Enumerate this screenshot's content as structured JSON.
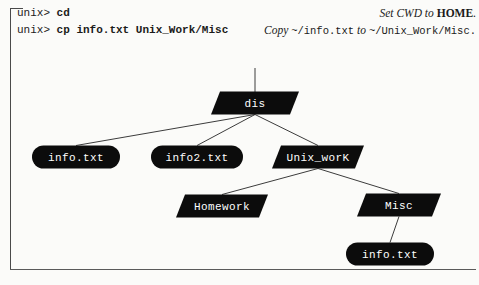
{
  "terminal": {
    "lines": [
      {
        "prompt": "unix> ",
        "command": "cd"
      },
      {
        "prompt": "unix> ",
        "command": "cp info.txt Unix_Work/Misc"
      }
    ]
  },
  "annotations": [
    {
      "parts": [
        {
          "text": "Set CWD to ",
          "style": "italic"
        },
        {
          "text": "HOME",
          "style": "bold"
        },
        {
          "text": ".",
          "style": "italic"
        }
      ]
    },
    {
      "parts": [
        {
          "text": "Copy ",
          "style": "italic"
        },
        {
          "text": "~/info.txt",
          "style": "mono"
        },
        {
          "text": " to ",
          "style": "italic"
        },
        {
          "text": "~/Unix_Work/Misc.",
          "style": "mono"
        }
      ]
    }
  ],
  "tree": {
    "root_stub": {
      "x": 255,
      "y1": 68,
      "y2": 92
    },
    "nodes": [
      {
        "id": "dis",
        "label": "dis",
        "kind": "directory",
        "cx": 255,
        "cy": 103,
        "w": 88,
        "h": 23
      },
      {
        "id": "info-txt-1",
        "label": "info.txt",
        "kind": "file",
        "cx": 76,
        "cy": 157,
        "w": 88,
        "h": 23
      },
      {
        "id": "info2-txt",
        "label": "info2.txt",
        "kind": "file",
        "cx": 197,
        "cy": 157,
        "w": 92,
        "h": 23
      },
      {
        "id": "unix-work",
        "label": "Unix_worK",
        "kind": "directory",
        "cx": 318,
        "cy": 157,
        "w": 92,
        "h": 23
      },
      {
        "id": "homework",
        "label": "Homework",
        "kind": "directory",
        "cx": 222,
        "cy": 206,
        "w": 92,
        "h": 23
      },
      {
        "id": "misc",
        "label": "Misc",
        "kind": "directory",
        "cx": 399,
        "cy": 205,
        "w": 84,
        "h": 23
      },
      {
        "id": "info-txt-2",
        "label": "info.txt",
        "kind": "file",
        "cx": 390,
        "cy": 254,
        "w": 88,
        "h": 23
      }
    ],
    "edges": [
      {
        "from": "dis",
        "to": "info-txt-1"
      },
      {
        "from": "dis",
        "to": "info2-txt"
      },
      {
        "from": "dis",
        "to": "unix-work"
      },
      {
        "from": "unix-work",
        "to": "homework"
      },
      {
        "from": "unix-work",
        "to": "misc"
      },
      {
        "from": "misc",
        "to": "info-txt-2"
      }
    ]
  },
  "colors": {
    "node_fill": "#0c0c0c",
    "node_text": "#ffffff",
    "edge": "#3c3c3c",
    "page_bg": "#fbfbf9",
    "ink": "#1b1b1b"
  }
}
